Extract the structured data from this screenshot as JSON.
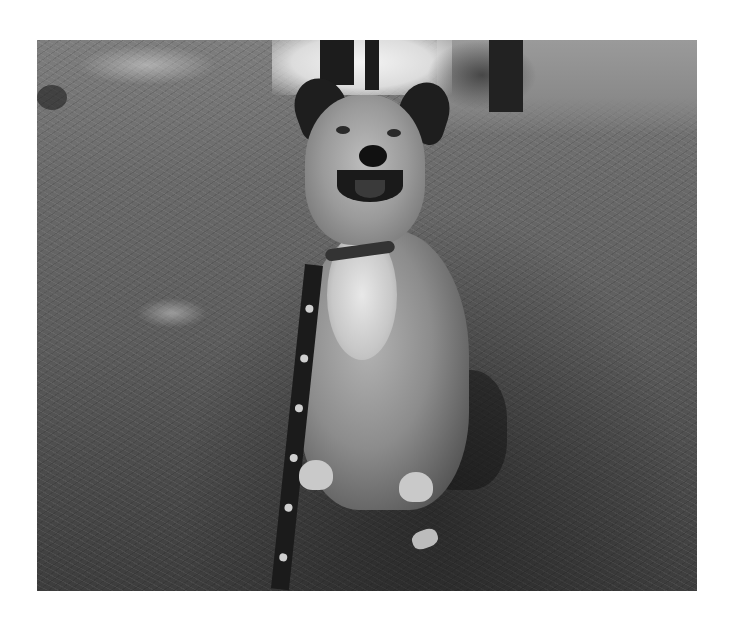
{
  "image": {
    "description": "Black-and-white photograph of a smiling dog sitting on pine-needle covered grass, wearing a collar and a patterned leash, with trees and a bright pond in the background",
    "colors": {
      "background": "#ffffff",
      "grass": "#5c5c5c",
      "dark": "#1c1c1c",
      "highlight": "#e8e8e8"
    }
  }
}
